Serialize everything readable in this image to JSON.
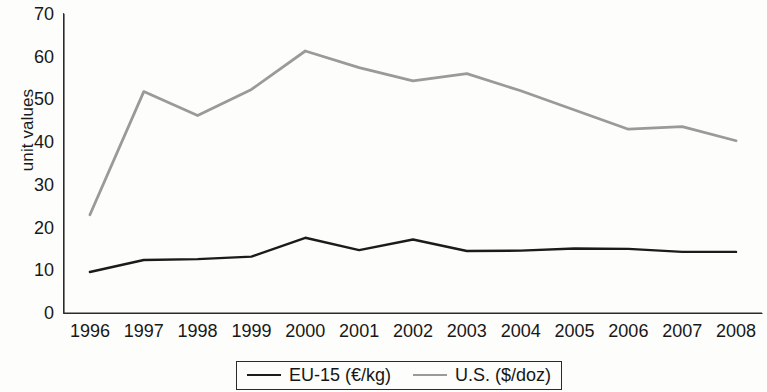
{
  "chart_data": {
    "type": "line",
    "title": "",
    "xlabel": "",
    "ylabel": "unit values",
    "x": [
      1996,
      1997,
      1998,
      1999,
      2000,
      2001,
      2002,
      2003,
      2004,
      2005,
      2006,
      2007,
      2008
    ],
    "xtick_labels": [
      "1996",
      "1997",
      "1998",
      "1999",
      "2000",
      "2001",
      "2002",
      "2003",
      "2004",
      "2005",
      "2006",
      "2007",
      "2008"
    ],
    "ytick_labels": [
      "0",
      "10",
      "20",
      "30",
      "40",
      "50",
      "60",
      "70"
    ],
    "ytick_values": [
      0,
      10,
      20,
      30,
      40,
      50,
      60,
      70
    ],
    "ylim": [
      0,
      70
    ],
    "grid": false,
    "legend_position": "bottom-center",
    "series": [
      {
        "name": "EU-15 (€/kg)",
        "color": "#1b1b1b",
        "values": [
          9.6,
          12.4,
          12.6,
          13.2,
          17.6,
          14.7,
          17.2,
          14.5,
          14.6,
          15.1,
          15.0,
          14.3,
          14.3
        ]
      },
      {
        "name": "U.S. ($/doz)",
        "color": "#9a9a9a",
        "values": [
          23.0,
          51.8,
          46.2,
          52.3,
          61.3,
          57.4,
          54.3,
          56.0,
          52.0,
          47.5,
          43.0,
          43.6,
          40.3
        ]
      }
    ]
  },
  "legend": {
    "entries": [
      {
        "label": "EU-15 (€/kg)"
      },
      {
        "label": "U.S. ($/doz)"
      }
    ]
  },
  "axis": {
    "y_title": "unit values",
    "axis_color": "#2b2b2b"
  }
}
